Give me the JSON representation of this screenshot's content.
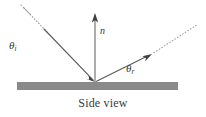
{
  "figure": {
    "caption": "Side view",
    "surface": {
      "color": "#8a8a8a",
      "x": 17,
      "y": 82,
      "width": 161,
      "height": 8
    },
    "hit_point": {
      "x": 95,
      "y": 82
    },
    "labels": {
      "incident_angle": {
        "symbol": "θ",
        "subscript": "i"
      },
      "reflected_angle": {
        "symbol": "θ",
        "subscript": "r"
      },
      "normal": "n"
    },
    "rays": {
      "incident": {
        "name": "incident-ray",
        "from": {
          "x": 27,
          "y": 11
        },
        "to": {
          "x": 95,
          "y": 82
        },
        "style": "solid-arrow",
        "color": "#4a4a4a"
      },
      "incident_extension": {
        "name": "incident-ray-extension",
        "from": {
          "x": 21,
          "y": 5
        },
        "to": {
          "x": 29,
          "y": 13
        },
        "style": "dotted",
        "color": "#9a9a9a"
      },
      "reflected": {
        "name": "reflected-ray",
        "from": {
          "x": 95,
          "y": 82
        },
        "to": {
          "x": 151,
          "y": 54
        },
        "style": "solid-arrow",
        "color": "#4a4a4a"
      },
      "reflected_extension": {
        "name": "reflected-ray-extension",
        "from": {
          "x": 152,
          "y": 53
        },
        "to": {
          "x": 196,
          "y": 25
        },
        "style": "dotted",
        "color": "#9a9a9a"
      },
      "normal": {
        "name": "normal-vector",
        "from": {
          "x": 95,
          "y": 82
        },
        "to": {
          "x": 95,
          "y": 14
        },
        "style": "solid-arrow",
        "color": "#6a6a6a"
      }
    }
  }
}
